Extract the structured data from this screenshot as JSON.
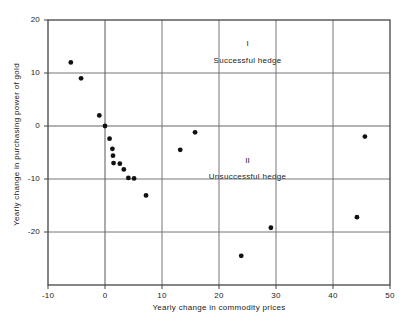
{
  "chart_data": {
    "type": "scatter",
    "title": "",
    "xlabel": "Yearly change in commodity prices",
    "ylabel": "Yearly change in purchasing power of gold",
    "xlim": [
      -10,
      50
    ],
    "ylim": [
      -30,
      20
    ],
    "xticks": [
      -10,
      0,
      10,
      20,
      30,
      40,
      50
    ],
    "xticklabels": [
      "-10",
      "0",
      "10",
      "20",
      "30",
      "40",
      "50"
    ],
    "yticks": [
      20,
      10,
      0,
      -10,
      -20
    ],
    "yticklabels": [
      "20",
      "10",
      "0",
      "-10",
      "-20"
    ],
    "grid": true,
    "gridlines_x": [
      0,
      10,
      20,
      30,
      40
    ],
    "gridlines_y": [
      10,
      0,
      -10,
      -20
    ],
    "legend": "none",
    "marker_color": "#111111",
    "axis_color": "#444444",
    "grid_color": "#666666",
    "points": [
      {
        "x": -6.0,
        "y": 12.0
      },
      {
        "x": -4.2,
        "y": 9.0
      },
      {
        "x": -1.0,
        "y": 2.0
      },
      {
        "x": 0.0,
        "y": 0.0
      },
      {
        "x": 0.8,
        "y": -2.4
      },
      {
        "x": 1.3,
        "y": -4.3
      },
      {
        "x": 1.4,
        "y": -5.6
      },
      {
        "x": 1.5,
        "y": -7.0
      },
      {
        "x": 2.6,
        "y": -7.1
      },
      {
        "x": 3.3,
        "y": -8.2
      },
      {
        "x": 4.1,
        "y": -9.8
      },
      {
        "x": 5.1,
        "y": -9.9
      },
      {
        "x": 7.2,
        "y": -13.1
      },
      {
        "x": 13.2,
        "y": -4.5
      },
      {
        "x": 15.8,
        "y": -1.2
      },
      {
        "x": 23.9,
        "y": -24.5
      },
      {
        "x": 29.1,
        "y": -19.2
      },
      {
        "x": 44.2,
        "y": -17.2
      },
      {
        "x": 45.6,
        "y": -2.0
      }
    ],
    "annotations": [
      {
        "id": "quadrant-1-numeral",
        "text": "I",
        "x": 25.0,
        "y": 15.5
      },
      {
        "id": "quadrant-1-label",
        "text": "Successful hedge",
        "x": 25.0,
        "y": 12.2
      },
      {
        "id": "quadrant-2-numeral",
        "text": "II",
        "x": 25.0,
        "y": -6.6
      },
      {
        "id": "quadrant-2-label",
        "text": "Unsuccessful hedge",
        "x": 25.0,
        "y": -9.6
      }
    ]
  }
}
